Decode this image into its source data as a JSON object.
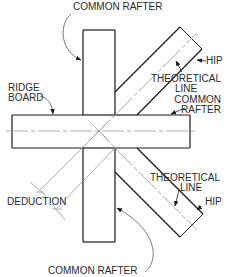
{
  "diagram": {
    "labels": {
      "common_rafter_top": "COMMON RAFTER",
      "hip_top": "HIP",
      "theoretical_line_top_1": "THEORETICAL",
      "theoretical_line_top_2": "LINE",
      "common_rafter_right_1": "COMMON",
      "common_rafter_right_2": "RAFTER",
      "ridge_board_1": "RIDGE",
      "ridge_board_2": "BOARD",
      "theoretical_line_bottom_1": "THEORETICAL",
      "theoretical_line_bottom_2": "LINE",
      "hip_bottom": "HIP",
      "deduction": "DEDUCTION",
      "common_rafter_bottom": "COMMON RAFTER"
    },
    "colors": {
      "line": "#1a1a1a",
      "centerline": "#9a9a9a",
      "text": "#2a2a2a"
    },
    "components": [
      "ridge board",
      "common rafter (top)",
      "common rafter (bottom)",
      "common rafter (right)",
      "hip (upper)",
      "hip (lower)",
      "theoretical line (upper)",
      "theoretical line (lower)",
      "deduction dimension"
    ]
  }
}
